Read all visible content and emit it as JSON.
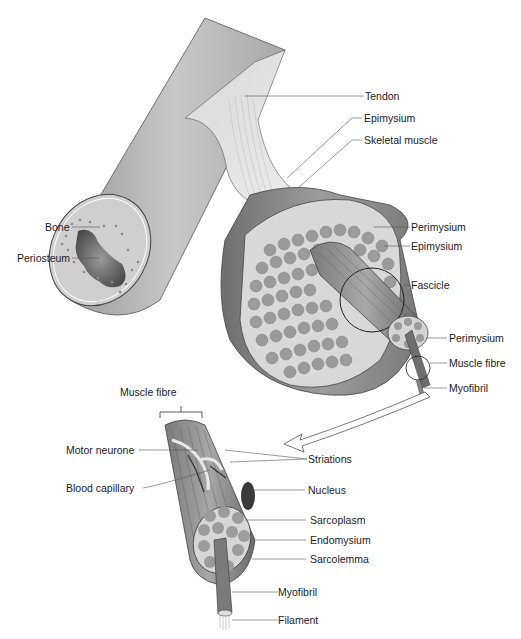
{
  "diagram": {
    "upper_labels": {
      "tendon": "Tendon",
      "epimysium_top": "Epimysium",
      "skeletal_muscle": "Skeletal muscle",
      "bone": "Bone",
      "periosteum": "Periosteum",
      "perimysium_1": "Perimysium",
      "epimysium_2": "Epimysium",
      "fascicle": "Fascicle",
      "perimysium_2": "Perimysium",
      "muscle_fibre": "Muscle fibre",
      "myofibril": "Myofibril"
    },
    "lower_labels": {
      "muscle_fibre": "Muscle fibre",
      "motor_neurone": "Motor neurone",
      "striations": "Striations",
      "blood_capillary": "Blood capillary",
      "nucleus": "Nucleus",
      "sarcoplasm": "Sarcoplasm",
      "endomysium": "Endomysium",
      "sarcolemma": "Sarcolemma",
      "myofibril": "Myofibril",
      "filament": "Filament"
    },
    "colors": {
      "bone": "#b8b8b8",
      "muscle": "#8a8a8a",
      "fibre_fill": "#a5a5a5",
      "cross_section": "#d4d4d4",
      "line": "#444444"
    }
  }
}
